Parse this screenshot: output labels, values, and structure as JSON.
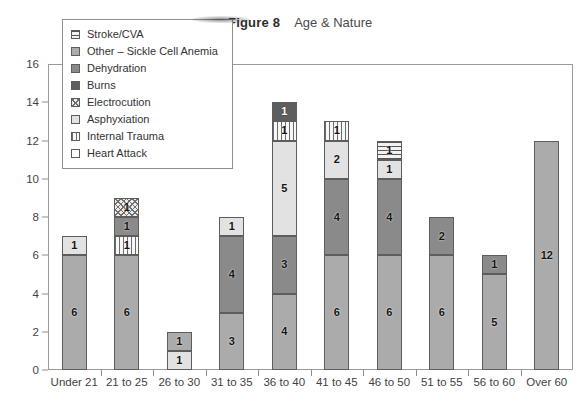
{
  "title": {
    "figure_label": "Figure 8",
    "subtitle": "Age & Nature"
  },
  "chart_data": {
    "type": "bar",
    "stacked": true,
    "xlabel": "",
    "ylabel": "",
    "ylim": [
      0,
      16
    ],
    "ytick_step": 2,
    "yticks": [
      0,
      2,
      4,
      6,
      8,
      10,
      12,
      14,
      16
    ],
    "grid": false,
    "legend_position": "top-left",
    "categories": [
      "Under 21",
      "21 to 25",
      "26 to 30",
      "31 to 35",
      "36 to 40",
      "41 to 45",
      "46 to 50",
      "51 to 55",
      "56 to 60",
      "Over 60"
    ],
    "series": [
      {
        "name": "Heart Attack",
        "fill": "heart",
        "color": "#ffffff",
        "values": [
          0,
          0,
          0,
          0,
          0,
          0,
          0,
          0,
          0,
          0
        ]
      },
      {
        "name": "Internal Trauma",
        "fill": "internal",
        "color": "#f2f2f2",
        "values": [
          0,
          1,
          0,
          0,
          1,
          1,
          0,
          0,
          0,
          0
        ]
      },
      {
        "name": "Asphyxiation",
        "fill": "asphyxiation",
        "color": "#e2e2e2",
        "values": [
          1,
          0,
          1,
          1,
          5,
          2,
          1,
          0,
          0,
          0
        ]
      },
      {
        "name": "Electrocution",
        "fill": "electrocution",
        "color": "#ededed",
        "values": [
          0,
          1,
          0,
          0,
          0,
          0,
          0,
          0,
          0,
          0
        ]
      },
      {
        "name": "Burns",
        "fill": "burns",
        "color": "#5e5e5e",
        "values": [
          0,
          0,
          0,
          0,
          1,
          0,
          0,
          0,
          0,
          0
        ]
      },
      {
        "name": "Dehydration",
        "fill": "dehydration",
        "color": "#8a8a8a",
        "values": [
          0,
          1,
          1,
          4,
          3,
          4,
          4,
          2,
          1,
          0
        ]
      },
      {
        "name": "Other – Sickle Cell Anemia",
        "fill": "other",
        "color": "#ababab",
        "values": [
          6,
          6,
          1,
          3,
          4,
          6,
          6,
          6,
          5,
          12
        ]
      },
      {
        "name": "Stroke/CVA",
        "fill": "stroke",
        "color": "#f2f2f2",
        "values": [
          0,
          0,
          0,
          0,
          0,
          0,
          1,
          0,
          0,
          0
        ]
      }
    ],
    "totals": [
      7,
      9,
      2,
      8,
      14,
      13,
      12,
      8,
      6,
      12
    ],
    "bars": [
      {
        "category": "Under 21",
        "total": 7,
        "segments": [
          {
            "label": "Other – Sickle Cell Anemia",
            "fill": "other",
            "value": 6
          },
          {
            "label": "Asphyxiation",
            "fill": "asphyxiation",
            "value": 1
          }
        ]
      },
      {
        "category": "21 to 25",
        "total": 9,
        "segments": [
          {
            "label": "Other – Sickle Cell Anemia",
            "fill": "other",
            "value": 6
          },
          {
            "label": "Internal Trauma",
            "fill": "internal",
            "value": 1
          },
          {
            "label": "Dehydration",
            "fill": "dehydration",
            "value": 1
          },
          {
            "label": "Electrocution",
            "fill": "electrocution",
            "value": 1
          }
        ]
      },
      {
        "category": "26 to 30",
        "total": 2,
        "segments": [
          {
            "label": "Asphyxiation",
            "fill": "asphyxiation",
            "value": 1
          },
          {
            "label": "Other – Sickle Cell Anemia",
            "fill": "other",
            "value": 1
          }
        ]
      },
      {
        "category": "31 to 35",
        "total": 8,
        "segments": [
          {
            "label": "Other – Sickle Cell Anemia",
            "fill": "other",
            "value": 3
          },
          {
            "label": "Dehydration",
            "fill": "dehydration",
            "value": 4
          },
          {
            "label": "Asphyxiation",
            "fill": "asphyxiation",
            "value": 1
          }
        ]
      },
      {
        "category": "36 to 40",
        "total": 14,
        "segments": [
          {
            "label": "Other – Sickle Cell Anemia",
            "fill": "other",
            "value": 4
          },
          {
            "label": "Dehydration",
            "fill": "dehydration",
            "value": 3
          },
          {
            "label": "Asphyxiation",
            "fill": "asphyxiation",
            "value": 5
          },
          {
            "label": "Internal Trauma",
            "fill": "internal",
            "value": 1
          },
          {
            "label": "Burns",
            "fill": "burns",
            "value": 1
          }
        ]
      },
      {
        "category": "41 to 45",
        "total": 13,
        "segments": [
          {
            "label": "Other – Sickle Cell Anemia",
            "fill": "other",
            "value": 6
          },
          {
            "label": "Dehydration",
            "fill": "dehydration",
            "value": 4
          },
          {
            "label": "Asphyxiation",
            "fill": "asphyxiation",
            "value": 2
          },
          {
            "label": "Internal Trauma",
            "fill": "internal",
            "value": 1
          }
        ]
      },
      {
        "category": "46 to 50",
        "total": 12,
        "segments": [
          {
            "label": "Other – Sickle Cell Anemia",
            "fill": "other",
            "value": 6
          },
          {
            "label": "Dehydration",
            "fill": "dehydration",
            "value": 4
          },
          {
            "label": "Asphyxiation",
            "fill": "asphyxiation",
            "value": 1
          },
          {
            "label": "Stroke/CVA",
            "fill": "stroke",
            "value": 1
          }
        ]
      },
      {
        "category": "51 to 55",
        "total": 8,
        "segments": [
          {
            "label": "Other – Sickle Cell Anemia",
            "fill": "other",
            "value": 6
          },
          {
            "label": "Dehydration",
            "fill": "dehydration",
            "value": 2
          }
        ]
      },
      {
        "category": "56 to 60",
        "total": 6,
        "segments": [
          {
            "label": "Other – Sickle Cell Anemia",
            "fill": "other",
            "value": 5
          },
          {
            "label": "Dehydration",
            "fill": "dehydration",
            "value": 1
          }
        ]
      },
      {
        "category": "Over 60",
        "total": 12,
        "segments": [
          {
            "label": "Other – Sickle Cell Anemia",
            "fill": "other",
            "value": 12
          }
        ]
      }
    ]
  },
  "legend": {
    "items": [
      {
        "label": "Stroke/CVA",
        "fill": "stroke"
      },
      {
        "label": "Other – Sickle Cell Anemia",
        "fill": "other"
      },
      {
        "label": "Dehydration",
        "fill": "dehydration"
      },
      {
        "label": "Burns",
        "fill": "burns"
      },
      {
        "label": "Electrocution",
        "fill": "electrocution"
      },
      {
        "label": "Asphyxiation",
        "fill": "asphyxiation"
      },
      {
        "label": "Internal Trauma",
        "fill": "internal"
      },
      {
        "label": "Heart Attack",
        "fill": "heart"
      }
    ]
  }
}
